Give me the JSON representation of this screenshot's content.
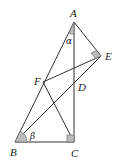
{
  "diagram": {
    "type": "geometry",
    "points": {
      "A": {
        "label": "A",
        "x": 74,
        "y": 22
      },
      "E": {
        "label": "E",
        "x": 101,
        "y": 56
      },
      "F": {
        "label": "F",
        "x": 43,
        "y": 82
      },
      "D": {
        "label": "D",
        "x": 74,
        "y": 84
      },
      "B": {
        "label": "B",
        "x": 15,
        "y": 142
      },
      "C": {
        "label": "C",
        "x": 74,
        "y": 142
      }
    },
    "segments": [
      [
        "A",
        "B"
      ],
      [
        "A",
        "C"
      ],
      [
        "A",
        "E"
      ],
      [
        "B",
        "C"
      ],
      [
        "F",
        "C"
      ],
      [
        "F",
        "E"
      ],
      [
        "B",
        "E"
      ]
    ],
    "angles": {
      "alpha": {
        "label": "α",
        "at": "A"
      },
      "beta": {
        "label": "β",
        "at": "B"
      }
    },
    "right_angles": [
      "C",
      "E"
    ]
  }
}
